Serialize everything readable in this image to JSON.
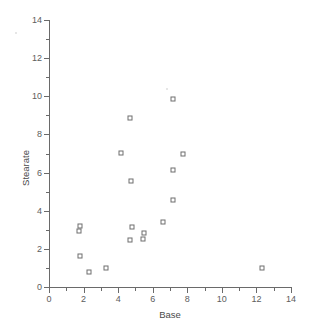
{
  "chart_data": {
    "type": "scatter",
    "title": "",
    "xlabel": "Base",
    "ylabel": "Stearate",
    "xlim": [
      0,
      14
    ],
    "ylim": [
      0,
      14
    ],
    "xticks": [
      0,
      2,
      4,
      6,
      8,
      10,
      12,
      14
    ],
    "yticks": [
      0,
      2,
      4,
      6,
      8,
      10,
      12,
      14
    ],
    "xtick_labels": [
      "0",
      "2",
      "4",
      "6",
      "8",
      "10",
      "12",
      "14"
    ],
    "ytick_labels": [
      "0",
      "2",
      "4",
      "6",
      "8",
      "10",
      "12",
      "14"
    ],
    "minor_ticks": true,
    "grid": false,
    "legend": false,
    "marker": "open-square",
    "marker_color": "#6e6e6e",
    "points": [
      {
        "x": 1.8,
        "y": 3.2
      },
      {
        "x": 1.75,
        "y": 2.95
      },
      {
        "x": 1.8,
        "y": 1.65
      },
      {
        "x": 2.3,
        "y": 0.78
      },
      {
        "x": 3.3,
        "y": 1.02
      },
      {
        "x": 4.15,
        "y": 7.05
      },
      {
        "x": 4.7,
        "y": 8.85
      },
      {
        "x": 4.75,
        "y": 5.55
      },
      {
        "x": 4.8,
        "y": 3.15
      },
      {
        "x": 4.7,
        "y": 2.45
      },
      {
        "x": 5.5,
        "y": 2.85
      },
      {
        "x": 5.45,
        "y": 2.5
      },
      {
        "x": 6.6,
        "y": 3.4
      },
      {
        "x": 7.15,
        "y": 9.85
      },
      {
        "x": 7.15,
        "y": 6.15
      },
      {
        "x": 7.2,
        "y": 4.55
      },
      {
        "x": 7.75,
        "y": 6.95
      },
      {
        "x": 12.35,
        "y": 1.02
      }
    ],
    "artifacts": [
      {
        "x": -1.9,
        "y": 13.3
      },
      {
        "x": 6.85,
        "y": 10.4
      }
    ]
  }
}
